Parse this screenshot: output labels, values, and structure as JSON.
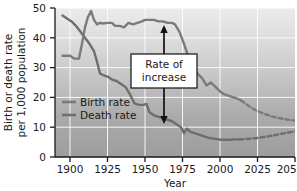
{
  "chart_data": {
    "type": "line",
    "title": "",
    "xlabel": "Year",
    "ylabel": "Birth or death rate per 1,000 population",
    "ylabel_line1": "Birth or death rate",
    "ylabel_line2": "per 1,000 population",
    "xlim": [
      1890,
      2050
    ],
    "ylim": [
      0,
      50
    ],
    "xticks": [
      1900,
      1925,
      1950,
      1975,
      2000,
      2025,
      2050
    ],
    "yticks": [
      0,
      10,
      20,
      30,
      40,
      50
    ],
    "xtick_labels": [
      "1900",
      "1925",
      "1950",
      "1975",
      "2000",
      "2025",
      "2050"
    ],
    "ytick_labels": [
      "0",
      "10",
      "20",
      "30",
      "40",
      "50"
    ],
    "grid": true,
    "legend_position": "inside-left",
    "series": [
      {
        "name": "Birth rate",
        "color": "#7b7b7b",
        "solid": {
          "x": [
            1895,
            1900,
            1903,
            1906,
            1908,
            1910,
            1912,
            1914,
            1916,
            1918,
            1920,
            1922,
            1925,
            1928,
            1930,
            1933,
            1936,
            1939,
            1942,
            1945,
            1948,
            1950,
            1953,
            1956,
            1959,
            1962,
            1965,
            1968,
            1970,
            1973,
            1976,
            1979,
            1982,
            1985,
            1988,
            1991,
            1994,
            1997,
            2000,
            2003,
            2006,
            2009,
            2012,
            2014
          ],
          "y": [
            34.0,
            34.0,
            33.0,
            33.0,
            38.0,
            43.5,
            47.0,
            49.0,
            46.0,
            44.5,
            45.0,
            44.8,
            45.0,
            45.0,
            44.0,
            44.0,
            43.5,
            45.0,
            44.5,
            45.0,
            45.5,
            46.0,
            46.0,
            46.0,
            45.5,
            45.5,
            45.0,
            45.0,
            44.5,
            42.0,
            38.0,
            33.5,
            30.0,
            28.0,
            26.5,
            24.0,
            25.0,
            23.5,
            22.0,
            21.0,
            20.5,
            20.0,
            19.5,
            19.0
          ]
        },
        "dashed": {
          "x": [
            2014,
            2018,
            2022,
            2026,
            2030,
            2034,
            2038,
            2042,
            2046,
            2050
          ],
          "y": [
            19.0,
            17.5,
            16.2,
            15.2,
            14.4,
            13.7,
            13.2,
            12.8,
            12.5,
            12.2
          ]
        }
      },
      {
        "name": "Death rate",
        "color": "#6e6e6e",
        "solid": {
          "x": [
            1895,
            1898,
            1901,
            1904,
            1907,
            1910,
            1913,
            1916,
            1918,
            1920,
            1922,
            1925,
            1928,
            1931,
            1934,
            1937,
            1940,
            1943,
            1946,
            1949,
            1951,
            1953,
            1956,
            1959,
            1962,
            1965,
            1968,
            1971,
            1974,
            1976,
            1978,
            1980,
            1983,
            1986,
            1989,
            1992,
            1995,
            1998,
            2001,
            2004,
            2007,
            2010,
            2013
          ],
          "y": [
            47.5,
            46.5,
            45.5,
            44.0,
            42.0,
            40.0,
            38.0,
            35.5,
            32.0,
            28.0,
            27.5,
            27.0,
            26.0,
            25.5,
            24.5,
            23.5,
            21.0,
            18.0,
            17.5,
            17.5,
            17.8,
            15.0,
            14.0,
            13.5,
            13.0,
            12.5,
            12.0,
            11.0,
            10.0,
            8.0,
            9.5,
            8.5,
            8.0,
            7.5,
            7.0,
            6.5,
            6.2,
            6.0,
            5.8,
            5.8,
            5.8,
            5.9,
            5.9
          ]
        },
        "dashed": {
          "x": [
            2013,
            2017,
            2021,
            2025,
            2029,
            2033,
            2037,
            2041,
            2045,
            2050
          ],
          "y": [
            5.9,
            6.0,
            6.2,
            6.4,
            6.7,
            7.0,
            7.4,
            7.8,
            8.2,
            8.6
          ]
        }
      }
    ],
    "annotations": [
      {
        "id": "rate-of-increase",
        "text_line1": "Rate of",
        "text_line2": "increase",
        "x": 1963,
        "y_top": 45.0,
        "y_bottom": 13.0,
        "arrow": "double-headed-vertical"
      }
    ],
    "legend_entries": [
      {
        "label": "Birth rate",
        "color": "#7b7b7b"
      },
      {
        "label": "Death rate",
        "color": "#6e6e6e"
      }
    ],
    "background": {
      "gradient_top": "#e9e9e9",
      "gradient_bottom": "#a3a3a3",
      "gridline_color": "#ffffff"
    }
  }
}
